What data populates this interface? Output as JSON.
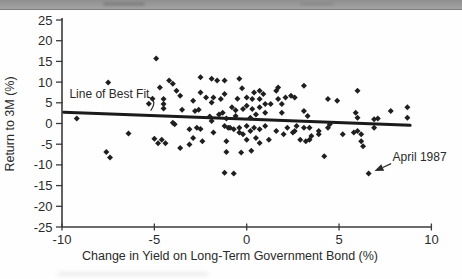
{
  "page": {
    "header_strip_color": "#999999",
    "background": "#fefefe"
  },
  "chart_data": {
    "type": "scatter",
    "title": "",
    "xlabel": "Change in Yield on Long-Term Government Bond (%)",
    "ylabel": "Return to 3M (%)",
    "xlim": [
      -10,
      10
    ],
    "ylim": [
      -25,
      25
    ],
    "xticks": [
      -10,
      -5,
      0,
      5,
      10
    ],
    "yticks": [
      25,
      20,
      15,
      10,
      5,
      0,
      -5,
      -10,
      -15,
      -20,
      -25
    ],
    "grid": false,
    "legend": "none",
    "marker": "diamond",
    "colors": {
      "marker": "#1f1f1f",
      "axis": "#3a3a3a",
      "text": "#2a2a2a",
      "trend_line": "#1b1b1b"
    },
    "points": [
      [
        -9.2,
        1.2
      ],
      [
        -7.5,
        9.9
      ],
      [
        -7.6,
        -6.9
      ],
      [
        -7.4,
        -8.2
      ],
      [
        -6.4,
        -2.4
      ],
      [
        -5.3,
        4.8
      ],
      [
        -5.1,
        6.0
      ],
      [
        -4.9,
        15.7
      ],
      [
        -5.0,
        -3.7
      ],
      [
        -4.6,
        -3.9
      ],
      [
        -4.8,
        -4.8
      ],
      [
        -4.4,
        -4.8
      ],
      [
        -4.7,
        8.7
      ],
      [
        -4.2,
        10.4
      ],
      [
        -4.5,
        5.9
      ],
      [
        -4.5,
        4.7
      ],
      [
        -4.5,
        3.6
      ],
      [
        -4.0,
        9.6
      ],
      [
        -4.0,
        0.2
      ],
      [
        -3.8,
        7.9
      ],
      [
        -3.6,
        6.7
      ],
      [
        -3.5,
        3.3
      ],
      [
        -3.9,
        -0.2
      ],
      [
        -3.6,
        -5.9
      ],
      [
        -3.1,
        -1.4
      ],
      [
        -3.1,
        -5.1
      ],
      [
        -2.9,
        5.5
      ],
      [
        -2.9,
        -3.5
      ],
      [
        -2.8,
        3.0
      ],
      [
        -2.6,
        3.3
      ],
      [
        -2.7,
        -1.0
      ],
      [
        -2.5,
        -1.3
      ],
      [
        -2.5,
        11.2
      ],
      [
        -2.5,
        7.5
      ],
      [
        -2.4,
        -4.3
      ],
      [
        -2.2,
        6.3
      ],
      [
        -2.0,
        1.7
      ],
      [
        -1.9,
        10.8
      ],
      [
        -1.9,
        5.1
      ],
      [
        -1.9,
        0.6
      ],
      [
        -1.8,
        6.3
      ],
      [
        -1.8,
        -2.2
      ],
      [
        -1.6,
        10.4
      ],
      [
        -1.5,
        2.2
      ],
      [
        -1.4,
        5.9
      ],
      [
        -1.3,
        2.6
      ],
      [
        -1.2,
        10.4
      ],
      [
        -1.2,
        7.1
      ],
      [
        -1.2,
        -0.6
      ],
      [
        -1.2,
        -11.9
      ],
      [
        -1.1,
        1.2
      ],
      [
        -1.1,
        -4.3
      ],
      [
        -1.1,
        -6.9
      ],
      [
        -1.0,
        -1.0
      ],
      [
        -0.9,
        -1.0
      ],
      [
        -0.8,
        3.9
      ],
      [
        -0.7,
        -1.4
      ],
      [
        -0.7,
        -12.1
      ],
      [
        -0.6,
        3.2
      ],
      [
        -0.6,
        1.8
      ],
      [
        -0.5,
        6.0
      ],
      [
        -0.4,
        10.8
      ],
      [
        -0.4,
        -1.0
      ],
      [
        -0.4,
        -2.2
      ],
      [
        -0.3,
        -7.0
      ],
      [
        -0.25,
        8.5
      ],
      [
        -0.2,
        3.5
      ],
      [
        -0.2,
        -2.6
      ],
      [
        0.0,
        6.3
      ],
      [
        0.0,
        4.3
      ],
      [
        0.0,
        -0.6
      ],
      [
        0.0,
        -3.9
      ],
      [
        0.25,
        -6.6
      ],
      [
        0.3,
        5.9
      ],
      [
        0.3,
        3.5
      ],
      [
        0.2,
        1.4
      ],
      [
        0.2,
        -1.8
      ],
      [
        0.4,
        7.5
      ],
      [
        0.5,
        2.2
      ],
      [
        0.4,
        -1.0
      ],
      [
        0.5,
        -3.5
      ],
      [
        0.7,
        7.9
      ],
      [
        0.7,
        5.9
      ],
      [
        0.7,
        3.9
      ],
      [
        0.7,
        -1.4
      ],
      [
        0.7,
        -4.7
      ],
      [
        0.9,
        7.1
      ],
      [
        1.0,
        4.7
      ],
      [
        1.0,
        2.6
      ],
      [
        1.0,
        -0.6
      ],
      [
        1.2,
        -3.9
      ],
      [
        1.3,
        4.7
      ],
      [
        1.6,
        7.9
      ],
      [
        1.6,
        -1.8
      ],
      [
        1.7,
        8.7
      ],
      [
        1.7,
        5.9
      ],
      [
        1.9,
        4.7
      ],
      [
        1.9,
        2.6
      ],
      [
        2.0,
        -2.6
      ],
      [
        2.1,
        6.3
      ],
      [
        2.2,
        -1.0
      ],
      [
        2.4,
        6.7
      ],
      [
        2.5,
        -2.2
      ],
      [
        2.6,
        6.3
      ],
      [
        2.6,
        -1.8
      ],
      [
        2.7,
        -0.6
      ],
      [
        2.9,
        -3.9
      ],
      [
        3.1,
        9.1
      ],
      [
        3.1,
        3.0
      ],
      [
        3.1,
        -1.0
      ],
      [
        3.2,
        -4.3
      ],
      [
        3.3,
        1.8
      ],
      [
        3.4,
        -1.0
      ],
      [
        3.4,
        -3.9
      ],
      [
        3.5,
        -3.0
      ],
      [
        3.9,
        -1.8
      ],
      [
        3.9,
        -2.6
      ],
      [
        4.2,
        -7.9
      ],
      [
        4.4,
        5.9
      ],
      [
        4.4,
        -1.0
      ],
      [
        4.5,
        -0.2
      ],
      [
        4.9,
        5.5
      ],
      [
        5.2,
        -2.6
      ],
      [
        5.8,
        -2.2
      ],
      [
        5.9,
        2.6
      ],
      [
        6.0,
        7.9
      ],
      [
        6.0,
        1.4
      ],
      [
        6.0,
        -1.8
      ],
      [
        6.2,
        -2.6
      ],
      [
        6.2,
        -4.3
      ],
      [
        6.3,
        -5.5
      ],
      [
        6.6,
        -12.1
      ],
      [
        6.9,
        1.0
      ],
      [
        6.9,
        -1.0
      ],
      [
        7.1,
        1.2
      ],
      [
        7.8,
        3.0
      ],
      [
        8.7,
        3.9
      ],
      [
        8.7,
        1.4
      ]
    ],
    "best_fit_line": {
      "x1": -9.9,
      "y1": 2.7,
      "x2": 8.85,
      "y2": -0.45
    },
    "annotations": [
      {
        "id": "best-fit",
        "text": "Line of Best Fit",
        "text_pos": [
          -9.6,
          6.2
        ],
        "leader": {
          "type": "curve",
          "from": [
            -5.34,
            6.4
          ],
          "ctrl": [
            -4.8,
            5.7
          ],
          "to": [
            -5.2,
            3.1
          ]
        }
      },
      {
        "id": "april-1987",
        "text": "April 1987",
        "text_pos": [
          7.9,
          -9.1
        ],
        "leader": {
          "type": "arrow",
          "from": [
            7.82,
            -9.7
          ],
          "to": [
            6.92,
            -11.5
          ]
        },
        "target_point": [
          6.6,
          -12.1
        ]
      }
    ]
  }
}
